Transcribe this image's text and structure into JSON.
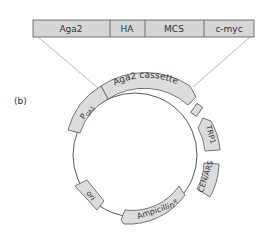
{
  "panel_label": "(b)",
  "cassette_bar": {
    "segments": [
      {
        "label": "Aga2"
      },
      {
        "label": "HA"
      },
      {
        "label": "MCS"
      },
      {
        "label": "c-myc"
      }
    ]
  },
  "plasmid": {
    "features": [
      {
        "label": "Aga2 cassette"
      },
      {
        "label": "P",
        "sub": "GA1"
      },
      {
        "label": "TRP1"
      },
      {
        "label": "CEN/ARS"
      },
      {
        "label": "Ampicillin",
        "sup": "R"
      },
      {
        "label": "ori"
      },
      {
        "label": "term"
      }
    ]
  },
  "colors": {
    "fill": "#dcdcdc",
    "stroke": "#555555",
    "text": "#333333"
  }
}
